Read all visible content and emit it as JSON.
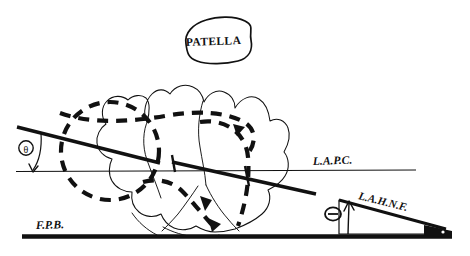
{
  "figure": {
    "background_color": "#ffffff",
    "ink_color": "#111111",
    "width": 470,
    "height": 256
  },
  "labels": {
    "patella": "PATELLA",
    "lapc": "L.A.P.C.",
    "lahnf": "L.A.H.N.F.",
    "fpb": "F.P.B.",
    "angle_left_symbol": "θ",
    "angle_right_symbol": "Θ"
  },
  "annotations": {
    "patella_shape": "hand-drawn-oval",
    "left_angle_name": "theta-left",
    "right_angle_name": "theta-right",
    "femoral_condyle_solid": "solid-thin-outline",
    "femoral_condyle_dashed": "thick-dashed-outline"
  },
  "lines": {
    "lapc_line_label": "L.A.P.C.",
    "fpb_line_label": "F.P.B.",
    "lahnf_line_label": "L.A.H.N.F.",
    "axis_line_upper": "thick-oblique-axis-upper",
    "axis_line_lower": "thick-oblique-axis-lower"
  }
}
